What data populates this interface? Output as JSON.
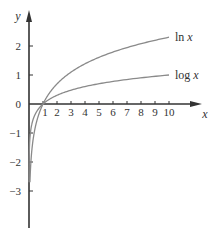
{
  "chart_data": {
    "type": "line",
    "title": "",
    "xlabel": "x",
    "ylabel": "y",
    "xlim": [
      0,
      11
    ],
    "ylim": [
      -3.9,
      3.2
    ],
    "grid": false,
    "legend_position": "inline labels at right end of curves",
    "x_ticks": [
      1,
      2,
      3,
      4,
      5,
      6,
      7,
      8,
      9,
      10
    ],
    "x_tick_labels": [
      "1",
      "2",
      "3",
      "4",
      "5",
      "6",
      "7",
      "8",
      "9",
      "10"
    ],
    "y_ticks": [
      -3,
      -2,
      -1,
      0,
      1,
      2
    ],
    "y_tick_labels": [
      "−3",
      "−2",
      "−1",
      "0",
      "1",
      "2"
    ],
    "series": [
      {
        "name": "ln x",
        "label": "ln x",
        "function": "ln",
        "color": "#8a8a8a",
        "x": [
          0.07,
          0.1,
          0.2,
          0.3,
          0.5,
          0.7,
          1,
          1.5,
          2,
          3,
          4,
          5,
          6,
          7,
          8,
          9,
          10
        ],
        "values": [
          -2.66,
          -2.3,
          -1.61,
          -1.2,
          -0.69,
          -0.36,
          0,
          0.41,
          0.69,
          1.1,
          1.39,
          1.61,
          1.79,
          1.95,
          2.08,
          2.2,
          2.3
        ]
      },
      {
        "name": "log x",
        "label": "log x",
        "function": "log10",
        "color": "#8a8a8a",
        "x": [
          0.003,
          0.01,
          0.03,
          0.1,
          0.2,
          0.3,
          0.5,
          0.7,
          1,
          1.5,
          2,
          3,
          4,
          5,
          6,
          7,
          8,
          9,
          10
        ],
        "values": [
          -2.52,
          -2.0,
          -1.52,
          -1.0,
          -0.7,
          -0.52,
          -0.3,
          -0.15,
          0,
          0.18,
          0.3,
          0.48,
          0.6,
          0.7,
          0.78,
          0.85,
          0.9,
          0.95,
          1.0
        ]
      }
    ]
  },
  "layout": {
    "origin_px": [
      29,
      104
    ],
    "x_unit_px": 14,
    "y_unit_px": 29,
    "x_axis_end_px": 202,
    "y_axis_top_px": 10,
    "y_axis_bottom_px": 228,
    "axis_color": "#333333"
  }
}
